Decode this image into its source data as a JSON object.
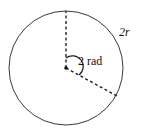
{
  "diagram": {
    "type": "circle-arc-radian",
    "circle": {
      "cx": 66,
      "cy": 68,
      "r": 57,
      "stroke": "#222222"
    },
    "arc_length_label": "2r",
    "angle_label": "2 rad",
    "radius_lines": "dashed",
    "angle_radians": 2
  }
}
